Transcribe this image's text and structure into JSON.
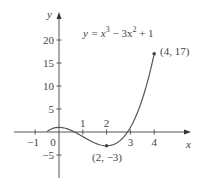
{
  "chart_data": {
    "type": "line",
    "equation": {
      "prefix": "y = x",
      "exp1": "3",
      "mid": " − 3x",
      "exp2": "2",
      "suffix": " + 1"
    },
    "xlabel": "x",
    "ylabel": "y",
    "xlim": [
      -1.3,
      5.5
    ],
    "ylim": [
      -10,
      26
    ],
    "x_ticks": [
      -1,
      0,
      1,
      2,
      3,
      4
    ],
    "x_tick_labels": [
      "−1",
      "0",
      "1",
      "2",
      "3",
      "4"
    ],
    "y_ticks": [
      -5,
      5,
      10,
      15,
      20
    ],
    "y_tick_labels": [
      "−5",
      "5",
      "10",
      "15",
      "20"
    ],
    "grid": false,
    "series": [
      {
        "name": "y = x³ − 3x² + 1",
        "domain": [
          -0.5,
          4
        ],
        "x": [
          -0.5,
          0,
          0.5,
          1,
          1.5,
          2,
          2.5,
          3,
          3.5,
          4
        ],
        "values": [
          0.125,
          1,
          0.375,
          -1,
          -2.375,
          -3,
          -2.125,
          1,
          7.125,
          17
        ]
      }
    ],
    "annotations": [
      {
        "label": "(2, −3)",
        "x": 2,
        "y": -3
      },
      {
        "label": "(4, 17)",
        "x": 4,
        "y": 17
      }
    ]
  }
}
